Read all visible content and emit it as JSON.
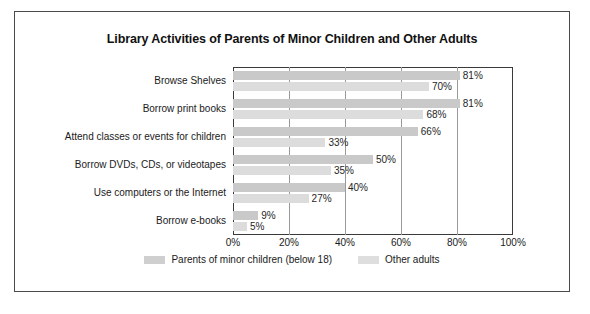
{
  "figure": {
    "title": "Library Activities of Parents of Minor Children and Other Adults"
  },
  "legend": {
    "items": [
      {
        "label": "Parents of minor children (below 18)",
        "color": "#cfcfcf"
      },
      {
        "label": "Other adults",
        "color": "#dedede"
      }
    ]
  },
  "axis": {
    "x_ticks": [
      "0%",
      "20%",
      "40%",
      "60%",
      "80%",
      "100%"
    ]
  },
  "chart_data": {
    "type": "bar",
    "orientation": "horizontal",
    "title": "Library Activities of Parents of Minor Children and Other Adults",
    "xlabel": "",
    "ylabel": "",
    "xlim": [
      0,
      100
    ],
    "x_ticks": [
      0,
      20,
      40,
      60,
      80,
      100
    ],
    "x_tick_labels": [
      "0%",
      "20%",
      "40%",
      "60%",
      "80%",
      "100%"
    ],
    "grid": "vertical",
    "legend_position": "bottom",
    "categories": [
      "Browse Shelves",
      "Borrow print books",
      "Attend classes or events for children",
      "Borrow DVDs, CDs, or videotapes",
      "Use computers or the Internet",
      "Borrow e-books"
    ],
    "series": [
      {
        "name": "Parents of minor children (below 18)",
        "color": "#c9c9c9",
        "values": [
          81,
          81,
          66,
          50,
          40,
          9
        ],
        "labels": [
          "81%",
          "81%",
          "66%",
          "50%",
          "40%",
          "9%"
        ]
      },
      {
        "name": "Other adults",
        "color": "#dcdcdc",
        "values": [
          70,
          68,
          33,
          35,
          27,
          5
        ],
        "labels": [
          "70%",
          "68%",
          "33%",
          "35%",
          "27%",
          "5%"
        ]
      }
    ]
  }
}
